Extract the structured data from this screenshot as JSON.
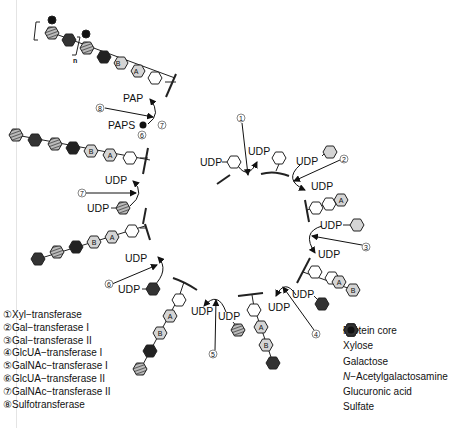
{
  "diagram": {
    "labels": {
      "udp": "UDP",
      "pap": "PAP",
      "paps": "PAPS",
      "repeat_n": "n",
      "galactose_a": "A",
      "galactose_b": "B"
    },
    "step_numbers": [
      "1",
      "2",
      "3",
      "4",
      "5",
      "6",
      "7",
      "8"
    ]
  },
  "enzyme_legend": [
    {
      "num": "①",
      "label": "Xyl−transferase"
    },
    {
      "num": "②",
      "label": "Gal−transferase I"
    },
    {
      "num": "③",
      "label": "Gal−transferase II"
    },
    {
      "num": "④",
      "label": "GlcUA−transferase I"
    },
    {
      "num": "⑤",
      "label": "GalNAc−transferase I"
    },
    {
      "num": "⑥",
      "label": "GlcUA−transferase II"
    },
    {
      "num": "⑦",
      "label": "GalNAc−transferase II"
    },
    {
      "num": "⑧",
      "label": "Sulfotransferase"
    }
  ],
  "symbol_legend": [
    {
      "icon": "protein-core-icon",
      "label": "Protein core"
    },
    {
      "icon": "xylose-icon",
      "label": "Xylose"
    },
    {
      "icon": "galactose-icon",
      "label": "Galactose"
    },
    {
      "icon": "galnac-icon",
      "label_italic": "N",
      "label": "−Acetylgalactosamine"
    },
    {
      "icon": "glucuronic-acid-icon",
      "label": "Glucuronic acid"
    },
    {
      "icon": "sulfate-icon",
      "label": "Sulfate"
    }
  ],
  "colors": {
    "xylose_fill": "#ffffff",
    "galactose_fill": "#d4d4d4",
    "glucuronic_fill": "#2a2a2a",
    "galnac_fill": "#9a9a9a",
    "sulfate_fill": "#111111",
    "stroke": "#222222"
  }
}
